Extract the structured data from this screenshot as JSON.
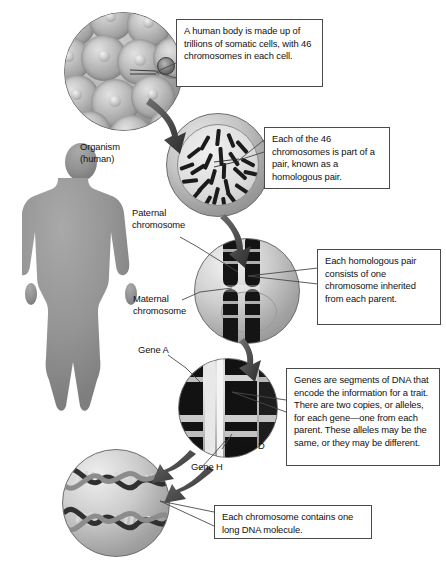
{
  "diagram": {
    "type": "biology-concept-diagram"
  },
  "labels": {
    "organism_line1": "Organism",
    "organism_line2": "(human)",
    "paternal_line1": "Paternal",
    "paternal_line2": "chromosome",
    "maternal_line1": "Maternal",
    "maternal_line2": "chromosome",
    "gene_a": "Gene A",
    "gene_d": "Gene D",
    "gene_h": "Gene H"
  },
  "callouts": {
    "cell": "A human body is made up of trillions of somatic cells, with 46 chromosomes in each cell.",
    "chromosome_pair": "Each of the 46 chromosomes is part of a pair, known as a homologous pair.",
    "homologous": "Each homologous pair consists of one chromosome inherited from each parent.",
    "genes": "Genes are segments of DNA that encode the information for a trait. There are two copies, or alleles, for each gene—one from each parent. These alleles may be the same, or they may be different.",
    "dna": "Each chromosome contains one long DNA molecule."
  },
  "figures": {
    "cell_cluster": "somatic-cell-cluster",
    "nucleus": "nucleus-with-46-chromosomes",
    "homologous_pair": "homologous-chromosome-pair",
    "gene_zoom": "gene-banding-zoom",
    "dna_helix": "dna-double-helix",
    "human_silhouette": "human-body-silhouette"
  },
  "colors": {
    "ink": "#111111",
    "box_border": "#4a4a4a",
    "leader_line": "#4a4a4a",
    "silhouette": "#8f8f8f",
    "chromosome_dark": "#141414",
    "sphere_light": "#efefef",
    "sphere_dark": "#878787",
    "background": "#ffffff"
  },
  "counts": {
    "chromosomes_per_cell": 46
  }
}
